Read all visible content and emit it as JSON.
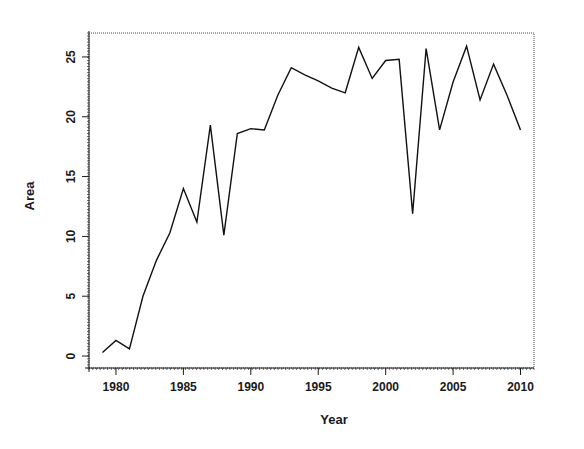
{
  "chart_data": {
    "type": "line",
    "title": "",
    "xlabel": "Year",
    "ylabel": "Area",
    "xlim": [
      1978.0,
      2011.0
    ],
    "ylim": [
      -1.0,
      27.0
    ],
    "grid": false,
    "legend": false,
    "legend_position": "none",
    "line_color": "#111111",
    "background_color": "#ffffff",
    "xticks": [
      1980,
      1985,
      1990,
      1995,
      2000,
      2005,
      2010
    ],
    "xtick_labels": [
      "1980",
      "1985",
      "1990",
      "1995",
      "2000",
      "2005",
      "2010"
    ],
    "yticks": [
      0,
      5,
      10,
      15,
      20,
      25
    ],
    "ytick_labels": [
      "0",
      "5",
      "10",
      "15",
      "20",
      "25"
    ],
    "x": [
      1979,
      1980,
      1981,
      1982,
      1983,
      1984,
      1985,
      1986,
      1987,
      1988,
      1989,
      1990,
      1991,
      1992,
      1993,
      1994,
      1995,
      1996,
      1997,
      1998,
      1999,
      2000,
      2001,
      2002,
      2003,
      2004,
      2005,
      2006,
      2007,
      2008,
      2009,
      2010
    ],
    "values": [
      0.3,
      1.3,
      0.6,
      5.0,
      8.0,
      10.3,
      14.0,
      11.2,
      19.3,
      10.1,
      18.6,
      19.0,
      18.9,
      21.8,
      24.1,
      23.5,
      23.0,
      22.4,
      22.0,
      25.8,
      23.2,
      24.7,
      24.8,
      11.9,
      25.7,
      18.9,
      22.9,
      25.9,
      21.4,
      24.4,
      21.8,
      18.9
    ],
    "series": [
      {
        "name": "Area",
        "values": [
          0.3,
          1.3,
          0.6,
          5.0,
          8.0,
          10.3,
          14.0,
          11.2,
          19.3,
          10.1,
          18.6,
          19.0,
          18.9,
          21.8,
          24.1,
          23.5,
          23.0,
          22.4,
          22.0,
          25.8,
          23.2,
          24.7,
          24.8,
          11.9,
          25.7,
          18.9,
          22.9,
          25.9,
          21.4,
          24.4,
          21.8,
          18.9
        ]
      }
    ]
  }
}
